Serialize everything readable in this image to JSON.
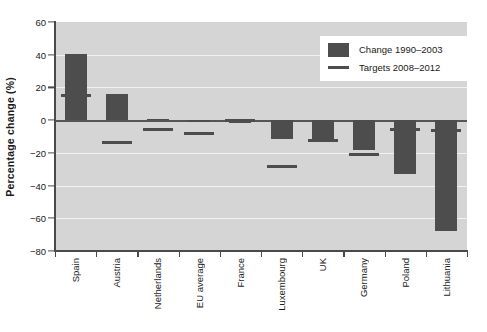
{
  "chart_data": {
    "type": "bar",
    "title": "",
    "xlabel": "",
    "ylabel": "Percentage change (%)",
    "ylim": [
      -80,
      60
    ],
    "yticks": [
      60,
      40,
      20,
      0,
      -20,
      -40,
      -60,
      -80
    ],
    "ytick_labels": [
      "60",
      "40",
      "20",
      "0",
      "−20",
      "−40",
      "−60",
      "−80"
    ],
    "grid": true,
    "grid_axis": "y",
    "legend_position": "top-right",
    "categories": [
      "Spain",
      "Austria",
      "Netherlands",
      "EU average",
      "France",
      "Luxembourg",
      "UK",
      "Germany",
      "Poland",
      "Lithuania"
    ],
    "series": [
      {
        "name": "Change 1990–2003",
        "type": "bar",
        "color": "#4d4d4d",
        "values": [
          40.5,
          16.0,
          0.8,
          -1.0,
          -2.0,
          -11.5,
          -12.5,
          -18.5,
          -33.0,
          -68.0
        ]
      },
      {
        "name": "Targets 2008–2012",
        "type": "marker-line",
        "color": "#4d4d4d",
        "values": [
          15.0,
          -13.5,
          -6.0,
          -8.0,
          0.0,
          -28.5,
          -12.5,
          -21.0,
          -6.0,
          -6.5
        ]
      }
    ]
  },
  "legend": {
    "items": [
      {
        "label": "Change 1990–2003",
        "marker": "bar-swatch"
      },
      {
        "label": "Targets 2008–2012",
        "marker": "line-swatch"
      }
    ]
  },
  "colors": {
    "bar": "#4d4d4d",
    "plot_background": "#d5d5d5",
    "gridline": "#f2f2f2",
    "axis": "#4a4a4a",
    "text": "#1a1a1a",
    "page_background": "#ffffff"
  }
}
